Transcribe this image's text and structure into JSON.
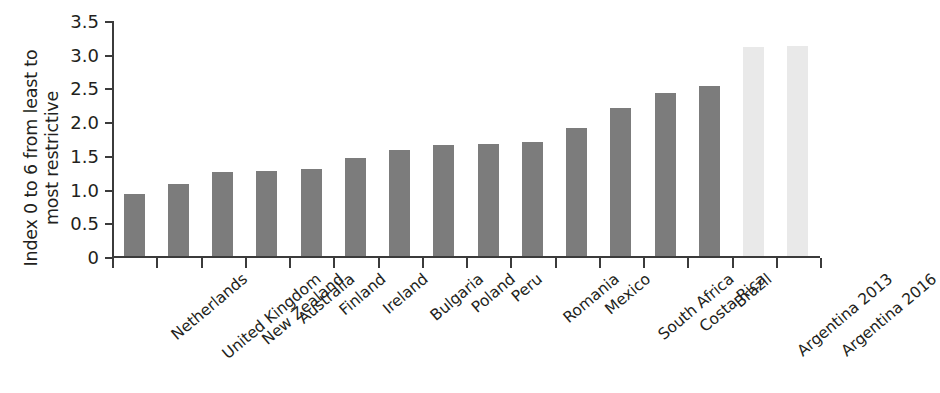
{
  "chart_data": {
    "type": "bar",
    "title": "",
    "subtitle": "",
    "xlabel": "",
    "ylabel": "Index 0 to 6 from least to most restrictive",
    "ylabel_lines": [
      "Index 0 to 6 from least to",
      "most restrictive"
    ],
    "ylim": [
      0,
      3.5
    ],
    "ytick_labels": [
      "0",
      "0.5",
      "1.0",
      "1.5",
      "2.0",
      "2.5",
      "3.0",
      "3.5"
    ],
    "ytick_values": [
      0,
      0.5,
      1.0,
      1.5,
      2.0,
      2.5,
      3.0,
      3.5
    ],
    "grid": false,
    "legend": null,
    "categories": [
      "Netherlands",
      "United Kingdom",
      "New Zealand",
      "Australia",
      "Finland",
      "Ireland",
      "Bulgaria",
      "Poland",
      "Peru",
      "Romania",
      "Mexico",
      "South Africa",
      "Costa Rica",
      "Brazil",
      "Argentina 2013",
      "Argentina 2016"
    ],
    "values": [
      0.92,
      1.07,
      1.25,
      1.26,
      1.29,
      1.45,
      1.57,
      1.65,
      1.66,
      1.69,
      1.9,
      2.2,
      2.42,
      2.52,
      3.1,
      3.12
    ],
    "bar_styles": [
      "dark",
      "dark",
      "dark",
      "dark",
      "dark",
      "dark",
      "dark",
      "dark",
      "dark",
      "dark",
      "dark",
      "dark",
      "dark",
      "dark",
      "light",
      "light"
    ],
    "colors": {
      "bar_dark": "#7c7c7c",
      "bar_light": "#e9e9e9",
      "axis": "#3b3b3b",
      "text": "#231f20",
      "background": "#ffffff"
    }
  }
}
